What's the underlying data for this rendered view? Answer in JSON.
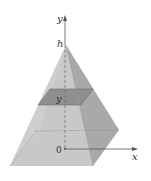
{
  "figure": {
    "labels": {
      "y_axis": "y",
      "apex_height": "h",
      "slice_height": "y",
      "origin": "0",
      "x_axis": "x"
    },
    "colors": {
      "front_face": "#c8c8c8",
      "right_face": "#a8a8a8",
      "slice": "#8f8f8f",
      "slice_edge": "#6e6e6e",
      "axis": "#555555",
      "hidden_line": "#7a7a7a",
      "background": "#ffffff"
    }
  }
}
